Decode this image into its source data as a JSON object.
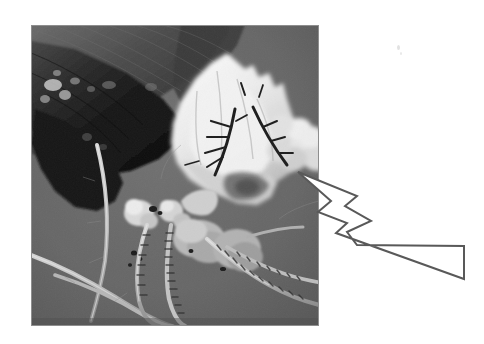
{
  "figure": {
    "kind": "annotated-photograph",
    "medium": "grayscale halftone print scan",
    "subject_caption": "Harvestman (daddy longlegs) entangled in a white silken / fungal mass beneath a dark dried leaf",
    "background_color": "#ffffff"
  },
  "photo": {
    "name": "specimen-photo",
    "x": 31,
    "y": 25,
    "width": 288,
    "height": 301,
    "background_gray": "#6e6e6e",
    "border_gray": "#8a8a8a",
    "tone_range": {
      "darkest": "#0d0d0d",
      "midtone": "#6e6e6e",
      "lightest": "#f4f4f4"
    },
    "regions": [
      {
        "name": "dark-leaf",
        "label": "Dark dried leaf / substrate",
        "position": "upper-left",
        "gray": "#232323"
      },
      {
        "name": "white-mass",
        "label": "White silken fungal mass",
        "position": "upper-center-right",
        "gray": "#f0f0f0"
      },
      {
        "name": "spider-body",
        "label": "Harvestman body",
        "position": "center",
        "gray": "#b8b8b8"
      },
      {
        "name": "spider-legs",
        "label": "Long banded legs",
        "position": "lower-left",
        "gray": "#c8c8c8"
      },
      {
        "name": "dark-spines",
        "label": "Dark spine-like projections",
        "position": "center-right",
        "gray": "#2a2a2a"
      },
      {
        "name": "grey-background",
        "label": "Uniform grey photographic background",
        "position": "full",
        "gray": "#6e6e6e"
      }
    ]
  },
  "annotation": {
    "name": "pointer-arrow",
    "type": "arrow",
    "label": "",
    "fill": "#ffffff",
    "stroke": "#595959",
    "stroke_width": 2,
    "direction": "up-left",
    "tip_x": 298,
    "tip_y": 172,
    "tail_x": 464,
    "tail_y": 262,
    "points_to": "white-mass"
  },
  "specks": [
    {
      "name": "dust-speck-1",
      "x": 397,
      "y": 45,
      "size": 3
    },
    {
      "name": "dust-speck-2",
      "x": 400,
      "y": 52,
      "size": 2
    }
  ]
}
